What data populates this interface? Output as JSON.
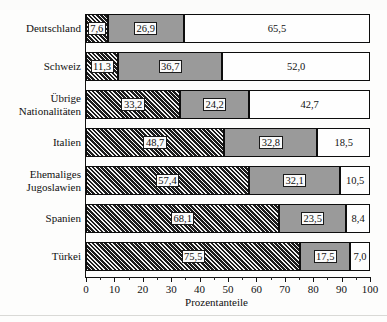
{
  "chart_data": {
    "type": "bar",
    "orientation": "horizontal",
    "stacked": true,
    "title": "",
    "xlabel": "Prozentanteile",
    "ylabel": "",
    "xlim": [
      0,
      100
    ],
    "xticks": [
      "0",
      "10",
      "20",
      "30",
      "40",
      "50",
      "60",
      "70",
      "80",
      "90",
      "100"
    ],
    "minor_tick_step": 5,
    "grid": false,
    "legend": "none",
    "categories": [
      "Deutschland",
      "Schweiz",
      "Übrige\nNationalitäten",
      "Italien",
      "Ehemaliges\nJugoslawien",
      "Spanien",
      "Türkei"
    ],
    "series": [
      {
        "name": "segment-1",
        "fill": "hatched",
        "values": [
          7.6,
          11.3,
          33.2,
          48.7,
          57.4,
          68.1,
          75.5
        ]
      },
      {
        "name": "segment-2",
        "fill": "gray",
        "values": [
          26.9,
          36.7,
          24.2,
          32.8,
          32.1,
          23.5,
          17.5
        ]
      },
      {
        "name": "segment-3",
        "fill": "white",
        "values": [
          65.5,
          52.0,
          42.7,
          18.5,
          10.5,
          8.4,
          7.0
        ]
      }
    ],
    "value_labels": [
      [
        "7,6",
        "26,9",
        "65,5"
      ],
      [
        "11,3",
        "36,7",
        "52,0"
      ],
      [
        "33,2",
        "24,2",
        "42,7"
      ],
      [
        "48,7",
        "32,8",
        "18,5"
      ],
      [
        "57,4",
        "32,1",
        "10,5"
      ],
      [
        "68,1",
        "23,5",
        "8,4"
      ],
      [
        "75,5",
        "17,5",
        "7,0"
      ]
    ],
    "colors": {
      "hatched": "#1c1c1c",
      "gray": "#9a9a9a",
      "white": "#fefefe",
      "outline": "#0d0d0d",
      "text": "#111111"
    }
  }
}
